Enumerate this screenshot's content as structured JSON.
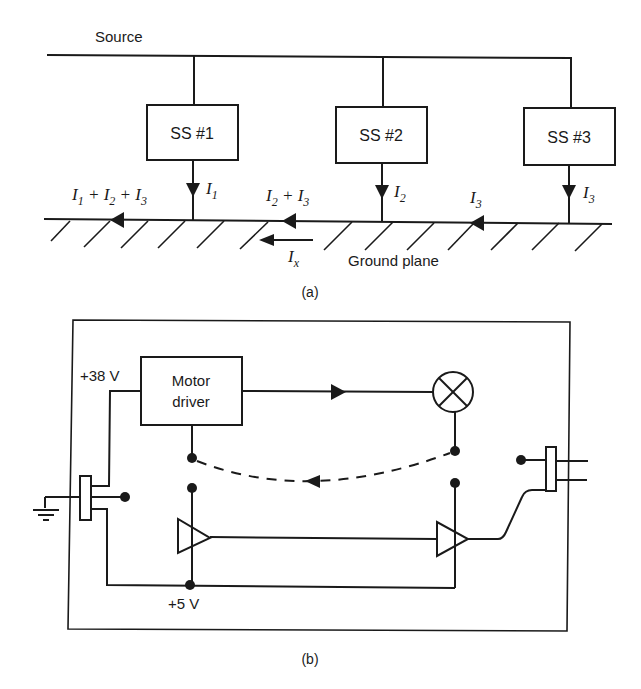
{
  "diagram_a": {
    "caption": "(a)",
    "source_label": "Source",
    "ground_label": "Ground plane",
    "subsystems": [
      {
        "label": "SS #1",
        "current": "1"
      },
      {
        "label": "SS #2",
        "current": "2"
      },
      {
        "label": "SS #3",
        "current": "3"
      }
    ],
    "current_labels": {
      "i_sym": "I",
      "total": {
        "parts": [
          "1",
          "2",
          "3"
        ]
      },
      "partial": {
        "parts": [
          "2",
          "3"
        ]
      },
      "segment3": "3",
      "ix_sub": "x",
      "plus": " + "
    }
  },
  "diagram_b": {
    "caption": "(b)",
    "motor_driver_line1": "Motor",
    "motor_driver_line2": "driver",
    "v_high": "+38 V",
    "v_low": "+5 V"
  },
  "colors": {
    "ink": "#1a1a1a",
    "background": "#ffffff"
  }
}
